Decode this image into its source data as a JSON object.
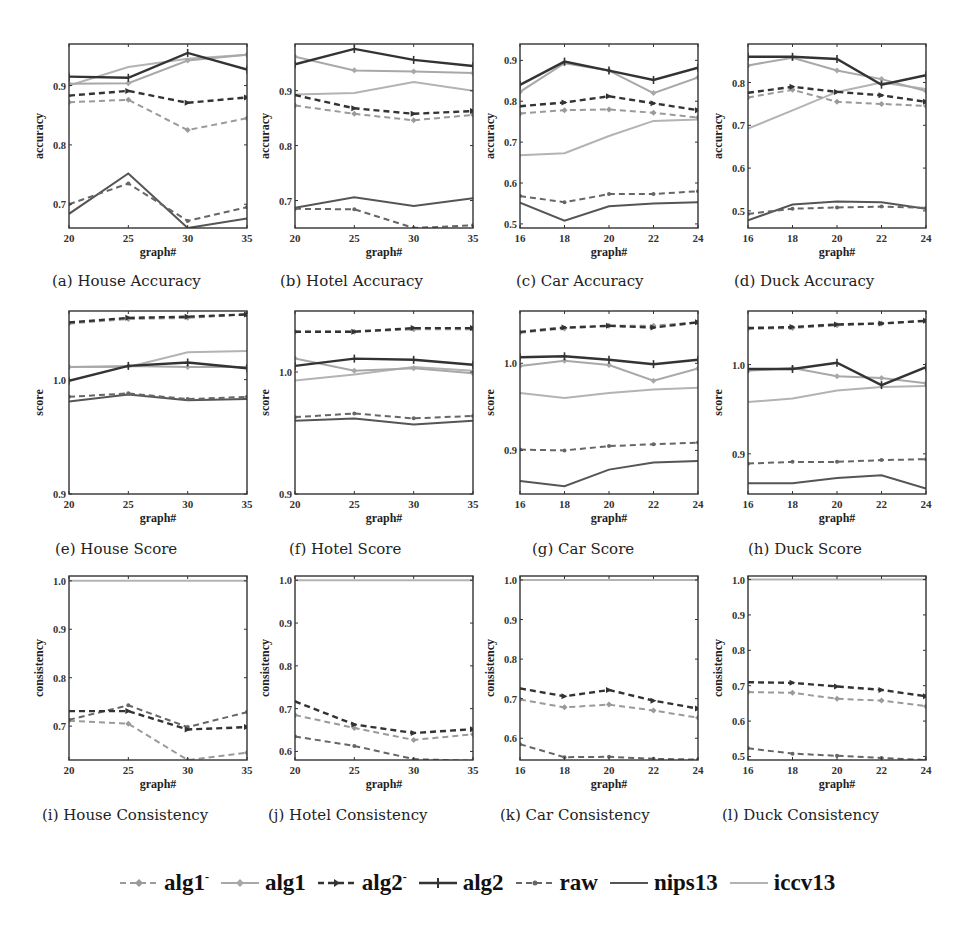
{
  "figure": {
    "legend": [
      {
        "key": "alg1m",
        "label": "alg1",
        "sup": "-",
        "color": "#9a9a9a",
        "dash": "6,4",
        "width": 2,
        "marker": "diamond"
      },
      {
        "key": "alg1",
        "label": "alg1",
        "sup": "",
        "color": "#a8a8a8",
        "dash": "",
        "width": 2,
        "marker": "diamond"
      },
      {
        "key": "alg2m",
        "label": "alg2",
        "sup": "-",
        "color": "#333333",
        "dash": "6,4",
        "width": 2.4,
        "marker": "arrow"
      },
      {
        "key": "alg2",
        "label": "alg2",
        "sup": "",
        "color": "#333333",
        "dash": "",
        "width": 2.4,
        "marker": "plus"
      },
      {
        "key": "raw",
        "label": "raw",
        "sup": "",
        "color": "#666666",
        "dash": "6,4",
        "width": 2,
        "marker": "dot"
      },
      {
        "key": "nips13",
        "label": "nips13",
        "sup": "",
        "color": "#555555",
        "dash": "",
        "width": 2,
        "marker": "none"
      },
      {
        "key": "iccv13",
        "label": "iccv13",
        "sup": "",
        "color": "#b3b3b3",
        "dash": "",
        "width": 2,
        "marker": "none"
      }
    ]
  },
  "chart_data": [
    {
      "id": "a",
      "caption": "(a) House Accuracy",
      "type": "line",
      "xlabel": "graph#",
      "ylabel": "accuracy",
      "x": [
        20,
        25,
        30,
        35
      ],
      "xticks": [
        "20",
        "25",
        "30",
        "35"
      ],
      "ylim": [
        0.66,
        0.97
      ],
      "yticks": [
        0.7,
        0.8,
        0.9
      ],
      "ytick_labels": [
        "0.7",
        "0.8",
        "0.9"
      ],
      "series": [
        {
          "name": "alg1-",
          "values": [
            0.872,
            0.876,
            0.825,
            0.845
          ]
        },
        {
          "name": "alg1",
          "values": [
            0.903,
            0.904,
            0.942,
            0.952
          ]
        },
        {
          "name": "alg2-",
          "values": [
            0.883,
            0.891,
            0.871,
            0.88
          ]
        },
        {
          "name": "alg2",
          "values": [
            0.915,
            0.913,
            0.955,
            0.927
          ]
        },
        {
          "name": "raw",
          "values": [
            0.7,
            0.735,
            0.672,
            0.695
          ]
        },
        {
          "name": "nips13",
          "values": [
            0.684,
            0.752,
            0.66,
            0.676
          ]
        },
        {
          "name": "iccv13",
          "values": [
            0.9,
            0.931,
            0.945,
            0.952
          ]
        }
      ]
    },
    {
      "id": "b",
      "caption": "(b) Hotel Accuracy",
      "type": "line",
      "xlabel": "graph#",
      "ylabel": "accuracy",
      "x": [
        20,
        25,
        30,
        35
      ],
      "xticks": [
        "20",
        "25",
        "30",
        "35"
      ],
      "ylim": [
        0.65,
        0.985
      ],
      "yticks": [
        0.7,
        0.8,
        0.9
      ],
      "ytick_labels": [
        "0.7",
        "0.8",
        "0.9"
      ],
      "series": [
        {
          "name": "alg1-",
          "values": [
            0.873,
            0.858,
            0.846,
            0.856
          ]
        },
        {
          "name": "alg1",
          "values": [
            0.962,
            0.937,
            0.935,
            0.932
          ]
        },
        {
          "name": "alg2-",
          "values": [
            0.892,
            0.868,
            0.858,
            0.863
          ]
        },
        {
          "name": "alg2",
          "values": [
            0.948,
            0.976,
            0.956,
            0.945
          ]
        },
        {
          "name": "raw",
          "values": [
            0.685,
            0.684,
            0.65,
            0.655
          ]
        },
        {
          "name": "nips13",
          "values": [
            0.687,
            0.706,
            0.69,
            0.704
          ]
        },
        {
          "name": "iccv13",
          "values": [
            0.893,
            0.896,
            0.916,
            0.9
          ]
        }
      ]
    },
    {
      "id": "c",
      "caption": "(c) Car Accuracy",
      "type": "line",
      "xlabel": "graph#",
      "ylabel": "accuracy",
      "x": [
        16,
        18,
        20,
        22,
        24
      ],
      "xticks": [
        "16",
        "18",
        "20",
        "22",
        "24"
      ],
      "ylim": [
        0.49,
        0.94
      ],
      "yticks": [
        0.5,
        0.6,
        0.7,
        0.8,
        0.9
      ],
      "ytick_labels": [
        "0.5",
        "0.6",
        "0.7",
        "0.8",
        "0.9"
      ],
      "series": [
        {
          "name": "alg1-",
          "values": [
            0.77,
            0.778,
            0.78,
            0.772,
            0.76
          ]
        },
        {
          "name": "alg1",
          "values": [
            0.823,
            0.893,
            0.875,
            0.82,
            0.858
          ]
        },
        {
          "name": "alg2-",
          "values": [
            0.788,
            0.797,
            0.812,
            0.795,
            0.778
          ]
        },
        {
          "name": "alg2",
          "values": [
            0.84,
            0.897,
            0.875,
            0.852,
            0.882
          ]
        },
        {
          "name": "raw",
          "values": [
            0.568,
            0.553,
            0.573,
            0.573,
            0.58
          ]
        },
        {
          "name": "nips13",
          "values": [
            0.552,
            0.508,
            0.543,
            0.55,
            0.553
          ]
        },
        {
          "name": "iccv13",
          "values": [
            0.668,
            0.673,
            0.715,
            0.752,
            0.755
          ]
        }
      ]
    },
    {
      "id": "d",
      "caption": "(d) Duck Accuracy",
      "type": "line",
      "xlabel": "graph#",
      "ylabel": "accuracy",
      "x": [
        16,
        18,
        20,
        22,
        24
      ],
      "xticks": [
        "16",
        "18",
        "20",
        "22",
        "24"
      ],
      "ylim": [
        0.46,
        0.89
      ],
      "yticks": [
        0.5,
        0.6,
        0.7,
        0.8
      ],
      "ytick_labels": [
        "0.5",
        "0.6",
        "0.7",
        "0.8"
      ],
      "series": [
        {
          "name": "alg1-",
          "values": [
            0.765,
            0.783,
            0.755,
            0.75,
            0.745
          ]
        },
        {
          "name": "alg1",
          "values": [
            0.84,
            0.858,
            0.828,
            0.808,
            0.78
          ]
        },
        {
          "name": "alg2-",
          "values": [
            0.776,
            0.79,
            0.778,
            0.77,
            0.755
          ]
        },
        {
          "name": "alg2",
          "values": [
            0.86,
            0.86,
            0.855,
            0.795,
            0.817
          ]
        },
        {
          "name": "raw",
          "values": [
            0.493,
            0.505,
            0.508,
            0.51,
            0.507
          ]
        },
        {
          "name": "nips13",
          "values": [
            0.478,
            0.515,
            0.522,
            0.52,
            0.505
          ]
        },
        {
          "name": "iccv13",
          "values": [
            0.692,
            0.735,
            0.778,
            0.8,
            0.785
          ]
        }
      ]
    },
    {
      "id": "e",
      "caption": "(e) House Score",
      "type": "line",
      "xlabel": "graph#",
      "ylabel": "score",
      "x": [
        20,
        25,
        30,
        35
      ],
      "xticks": [
        "20",
        "25",
        "30",
        "35"
      ],
      "ylim": [
        0.9,
        1.06
      ],
      "yticks": [
        0.9,
        1.0
      ],
      "ytick_labels": [
        "0.9",
        "1.0"
      ],
      "series": [
        {
          "name": "alg1-",
          "values": [
            1.049,
            1.053,
            1.054,
            1.057
          ]
        },
        {
          "name": "alg1",
          "values": [
            1.011,
            1.012,
            1.011,
            1.011
          ]
        },
        {
          "name": "alg2-",
          "values": [
            1.05,
            1.054,
            1.055,
            1.057
          ]
        },
        {
          "name": "alg2",
          "values": [
            0.999,
            1.012,
            1.015,
            1.01
          ]
        },
        {
          "name": "raw",
          "values": [
            0.985,
            0.988,
            0.983,
            0.985
          ]
        },
        {
          "name": "nips13",
          "values": [
            0.981,
            0.987,
            0.982,
            0.983
          ]
        },
        {
          "name": "iccv13",
          "values": [
            1.011,
            1.011,
            1.024,
            1.025
          ]
        }
      ]
    },
    {
      "id": "f",
      "caption": "(f) Hotel Score",
      "type": "line",
      "xlabel": "graph#",
      "ylabel": "score",
      "x": [
        20,
        25,
        30,
        35
      ],
      "xticks": [
        "20",
        "25",
        "30",
        "35"
      ],
      "ylim": [
        0.9,
        1.05
      ],
      "yticks": [
        0.9,
        1.0
      ],
      "ytick_labels": [
        "0.9",
        "1.0"
      ],
      "series": [
        {
          "name": "alg1-",
          "values": [
            1.033,
            1.033,
            1.035,
            1.035
          ]
        },
        {
          "name": "alg1",
          "values": [
            1.011,
            1.001,
            1.003,
            0.999
          ]
        },
        {
          "name": "alg2-",
          "values": [
            1.033,
            1.033,
            1.036,
            1.036
          ]
        },
        {
          "name": "alg2",
          "values": [
            1.005,
            1.011,
            1.01,
            1.006
          ]
        },
        {
          "name": "raw",
          "values": [
            0.963,
            0.966,
            0.962,
            0.964
          ]
        },
        {
          "name": "nips13",
          "values": [
            0.96,
            0.962,
            0.957,
            0.96
          ]
        },
        {
          "name": "iccv13",
          "values": [
            0.993,
            0.998,
            1.004,
            1.001
          ]
        }
      ]
    },
    {
      "id": "g",
      "caption": "(g) Car Score",
      "type": "line",
      "xlabel": "graph#",
      "ylabel": "score",
      "x": [
        16,
        18,
        20,
        22,
        24
      ],
      "xticks": [
        "16",
        "18",
        "20",
        "22",
        "24"
      ],
      "ylim": [
        0.85,
        1.06
      ],
      "yticks": [
        0.9,
        1.0
      ],
      "ytick_labels": [
        "0.9",
        "1.0"
      ],
      "series": [
        {
          "name": "alg1-",
          "values": [
            1.035,
            1.04,
            1.043,
            1.043,
            1.047
          ]
        },
        {
          "name": "alg1",
          "values": [
            0.997,
            1.003,
            0.998,
            0.98,
            0.994
          ]
        },
        {
          "name": "alg2-",
          "values": [
            1.036,
            1.041,
            1.043,
            1.041,
            1.047
          ]
        },
        {
          "name": "alg2",
          "values": [
            1.007,
            1.008,
            1.004,
            0.999,
            1.004
          ]
        },
        {
          "name": "raw",
          "values": [
            0.901,
            0.9,
            0.905,
            0.907,
            0.909
          ]
        },
        {
          "name": "nips13",
          "values": [
            0.865,
            0.859,
            0.878,
            0.886,
            0.888
          ]
        },
        {
          "name": "iccv13",
          "values": [
            0.966,
            0.96,
            0.966,
            0.97,
            0.972
          ]
        }
      ]
    },
    {
      "id": "h",
      "caption": "(h) Duck Score",
      "type": "line",
      "xlabel": "graph#",
      "ylabel": "score",
      "x": [
        16,
        18,
        20,
        22,
        24
      ],
      "xticks": [
        "16",
        "18",
        "20",
        "22",
        "24"
      ],
      "ylim": [
        0.855,
        1.06
      ],
      "yticks": [
        0.9,
        1.0
      ],
      "ytick_labels": [
        "0.9",
        "1.0"
      ],
      "series": [
        {
          "name": "alg1-",
          "values": [
            1.04,
            1.041,
            1.044,
            1.046,
            1.049
          ]
        },
        {
          "name": "alg1",
          "values": [
            0.993,
            0.996,
            0.987,
            0.985,
            0.979
          ]
        },
        {
          "name": "alg2-",
          "values": [
            1.041,
            1.042,
            1.045,
            1.046,
            1.049
          ]
        },
        {
          "name": "alg2",
          "values": [
            0.995,
            0.995,
            1.002,
            0.977,
            0.997
          ]
        },
        {
          "name": "raw",
          "values": [
            0.889,
            0.891,
            0.891,
            0.893,
            0.894
          ]
        },
        {
          "name": "nips13",
          "values": [
            0.867,
            0.867,
            0.873,
            0.876,
            0.861
          ]
        },
        {
          "name": "iccv13",
          "values": [
            0.958,
            0.962,
            0.971,
            0.975,
            0.976
          ]
        }
      ]
    },
    {
      "id": "i",
      "caption": "(i) House Consistency",
      "type": "line",
      "xlabel": "graph#",
      "ylabel": "consistency",
      "x": [
        20,
        25,
        30,
        35
      ],
      "xticks": [
        "20",
        "25",
        "30",
        "35"
      ],
      "ylim": [
        0.63,
        1.01
      ],
      "yticks": [
        0.7,
        0.8,
        0.9,
        1.0
      ],
      "ytick_labels": [
        "0.7",
        "0.8",
        "0.9",
        "1.0"
      ],
      "series": [
        {
          "name": "alg1-",
          "values": [
            0.711,
            0.705,
            0.63,
            0.645
          ]
        },
        {
          "name": "alg2-",
          "values": [
            0.731,
            0.731,
            0.693,
            0.698
          ]
        },
        {
          "name": "raw",
          "values": [
            0.713,
            0.743,
            0.698,
            0.729
          ]
        },
        {
          "name": "iccv13",
          "values": [
            1.0,
            1.0,
            1.0,
            1.0
          ]
        }
      ]
    },
    {
      "id": "j",
      "caption": "(j) Hotel Consistency",
      "type": "line",
      "xlabel": "graph#",
      "ylabel": "consistency",
      "x": [
        20,
        25,
        30,
        35
      ],
      "xticks": [
        "20",
        "25",
        "30",
        "35"
      ],
      "ylim": [
        0.58,
        1.01
      ],
      "yticks": [
        0.6,
        0.7,
        0.8,
        0.9,
        1.0
      ],
      "ytick_labels": [
        "0.6",
        "0.7",
        "0.8",
        "0.9",
        "1.0"
      ],
      "series": [
        {
          "name": "alg1-",
          "values": [
            0.685,
            0.655,
            0.627,
            0.64
          ]
        },
        {
          "name": "alg2-",
          "values": [
            0.717,
            0.663,
            0.643,
            0.652
          ]
        },
        {
          "name": "raw",
          "values": [
            0.635,
            0.613,
            0.582,
            0.578
          ]
        },
        {
          "name": "iccv13",
          "values": [
            1.0,
            1.0,
            1.0,
            1.0
          ]
        }
      ]
    },
    {
      "id": "k",
      "caption": "(k) Car Consistency",
      "type": "line",
      "xlabel": "graph#",
      "ylabel": "consistency",
      "x": [
        16,
        18,
        20,
        22,
        24
      ],
      "xticks": [
        "16",
        "18",
        "20",
        "22",
        "24"
      ],
      "ylim": [
        0.545,
        1.01
      ],
      "yticks": [
        0.6,
        0.7,
        0.8,
        0.9,
        1.0
      ],
      "ytick_labels": [
        "0.6",
        "0.7",
        "0.8",
        "0.9",
        "1.0"
      ],
      "series": [
        {
          "name": "alg1-",
          "values": [
            0.698,
            0.678,
            0.685,
            0.67,
            0.652
          ]
        },
        {
          "name": "alg2-",
          "values": [
            0.726,
            0.706,
            0.722,
            0.695,
            0.675
          ]
        },
        {
          "name": "raw",
          "values": [
            0.585,
            0.552,
            0.553,
            0.548,
            0.546
          ]
        },
        {
          "name": "iccv13",
          "values": [
            1.0,
            1.0,
            1.0,
            1.0,
            1.0
          ]
        }
      ]
    },
    {
      "id": "l",
      "caption": "(l) Duck Consistency",
      "type": "line",
      "xlabel": "graph#",
      "ylabel": "consistency",
      "x": [
        16,
        18,
        20,
        22,
        24
      ],
      "xticks": [
        "16",
        "18",
        "20",
        "22",
        "24"
      ],
      "ylim": [
        0.49,
        1.01
      ],
      "yticks": [
        0.5,
        0.6,
        0.7,
        0.8,
        0.9,
        1.0
      ],
      "ytick_labels": [
        "0.5",
        "0.6",
        "0.7",
        "0.8",
        "0.9",
        "1.0"
      ],
      "series": [
        {
          "name": "alg1-",
          "values": [
            0.682,
            0.68,
            0.663,
            0.658,
            0.642
          ]
        },
        {
          "name": "alg2-",
          "values": [
            0.71,
            0.708,
            0.698,
            0.688,
            0.67
          ]
        },
        {
          "name": "raw",
          "values": [
            0.523,
            0.508,
            0.502,
            0.496,
            0.49
          ]
        },
        {
          "name": "iccv13",
          "values": [
            1.0,
            1.0,
            1.0,
            1.0,
            1.0
          ]
        }
      ]
    }
  ]
}
